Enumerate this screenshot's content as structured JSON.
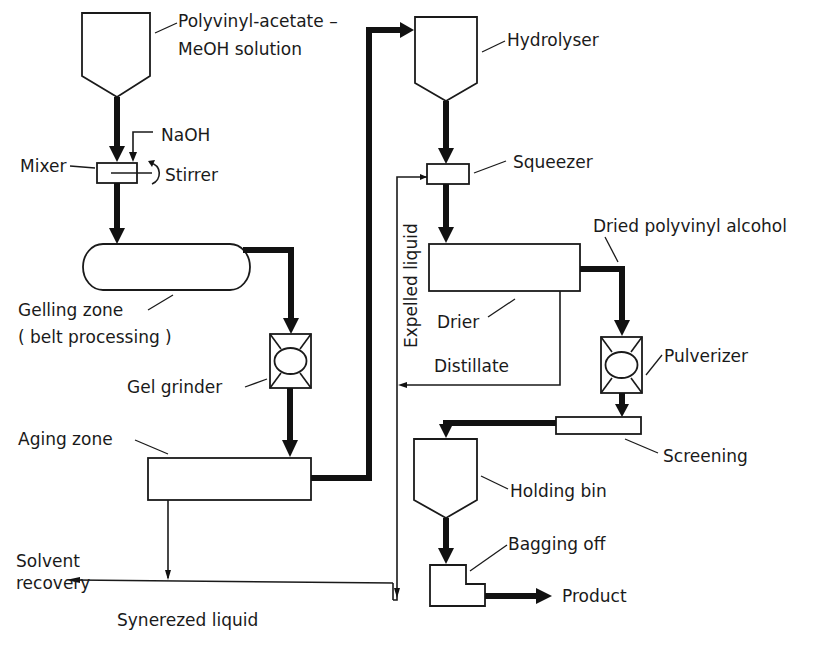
{
  "diagram": {
    "colors": {
      "ink": "#1a1a1a",
      "background": "#ffffff"
    },
    "labels": {
      "pvac_line1": "Polyvinyl-acetate –",
      "pvac_line2": "MeOH solution",
      "naoh": "NaOH",
      "mixer": "Mixer",
      "stirrer": "Stirrer",
      "gelling_line1": "Gelling zone",
      "gelling_line2": "( belt processing )",
      "gel_grinder": "Gel grinder",
      "aging_zone": "Aging zone",
      "solvent_line1": "Solvent",
      "solvent_line2": "recovery",
      "synerezed": "Synerezed liquid",
      "hydrolyser": "Hydrolyser",
      "squeezer": "Squeezer",
      "expelled": "Expelled liquid",
      "dried_pva": "Dried polyvinyl alcohol",
      "drier": "Drier",
      "distillate": "Distillate",
      "pulverizer": "Pulverizer",
      "screening": "Screening",
      "holding_bin": "Holding bin",
      "bagging_off": "Bagging off",
      "product": "Product"
    },
    "nodes": [
      {
        "id": "pvac-feed-hopper",
        "label": "Polyvinyl-acetate – MeOH solution",
        "shape": "hopper"
      },
      {
        "id": "mixer",
        "label": "Mixer",
        "shape": "box",
        "inputs": [
          "NaOH"
        ],
        "accessory": "Stirrer"
      },
      {
        "id": "gelling-zone",
        "label": "Gelling zone (belt processing)",
        "shape": "pill"
      },
      {
        "id": "gel-grinder",
        "label": "Gel grinder",
        "shape": "grinder"
      },
      {
        "id": "aging-zone",
        "label": "Aging zone",
        "shape": "box"
      },
      {
        "id": "hydrolyser",
        "label": "Hydrolyser",
        "shape": "hopper"
      },
      {
        "id": "squeezer",
        "label": "Squeezer",
        "shape": "box"
      },
      {
        "id": "drier",
        "label": "Drier",
        "shape": "box"
      },
      {
        "id": "pulverizer",
        "label": "Pulverizer",
        "shape": "grinder"
      },
      {
        "id": "screening",
        "label": "Screening",
        "shape": "box"
      },
      {
        "id": "holding-bin",
        "label": "Holding bin",
        "shape": "hopper"
      },
      {
        "id": "bagging-off",
        "label": "Bagging off",
        "shape": "L-box"
      }
    ],
    "edges": [
      {
        "from": "pvac-feed-hopper",
        "to": "mixer",
        "type": "main"
      },
      {
        "from": "NaOH",
        "to": "mixer",
        "type": "minor"
      },
      {
        "from": "mixer",
        "to": "gelling-zone",
        "type": "main"
      },
      {
        "from": "gelling-zone",
        "to": "gel-grinder",
        "type": "main"
      },
      {
        "from": "gel-grinder",
        "to": "aging-zone",
        "type": "main"
      },
      {
        "from": "aging-zone",
        "to": "hydrolyser",
        "type": "main"
      },
      {
        "from": "aging-zone",
        "to": "solvent-recovery",
        "type": "minor",
        "label": "Synerezed liquid"
      },
      {
        "from": "hydrolyser",
        "to": "squeezer",
        "type": "main"
      },
      {
        "from": "squeezer",
        "to": "solvent-recovery",
        "type": "minor",
        "label": "Expelled liquid"
      },
      {
        "from": "squeezer",
        "to": "drier",
        "type": "main"
      },
      {
        "from": "drier",
        "to": "expelled-liquid-line",
        "type": "minor",
        "label": "Distillate"
      },
      {
        "from": "drier",
        "to": "pulverizer",
        "type": "main",
        "label": "Dried polyvinyl alcohol"
      },
      {
        "from": "pulverizer",
        "to": "screening",
        "type": "main"
      },
      {
        "from": "screening",
        "to": "holding-bin",
        "type": "main"
      },
      {
        "from": "holding-bin",
        "to": "bagging-off",
        "type": "main"
      },
      {
        "from": "bagging-off",
        "to": "product",
        "type": "main"
      }
    ]
  }
}
